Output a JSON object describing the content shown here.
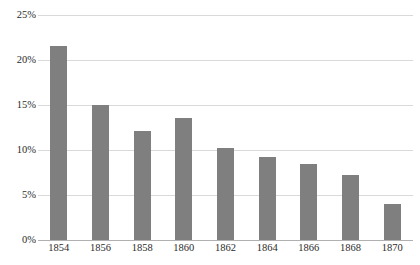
{
  "chart_data": {
    "type": "bar",
    "title": "",
    "subtitle": "",
    "xlabel": "",
    "ylabel": "",
    "categories": [
      "1854",
      "1856",
      "1858",
      "1860",
      "1862",
      "1864",
      "1866",
      "1868",
      "1870"
    ],
    "values": [
      21.6,
      15.0,
      12.1,
      13.6,
      10.2,
      9.2,
      8.4,
      7.2,
      4.0
    ],
    "ylim": [
      0,
      25
    ],
    "yticks": [
      0,
      5,
      10,
      15,
      20,
      25
    ],
    "ytick_labels": [
      "0%",
      "5%",
      "10%",
      "15%",
      "20%",
      "25%"
    ],
    "grid": true,
    "grid_axis": "y",
    "legend": false,
    "legend_position": "none",
    "bar_color": "#7f7f7f",
    "grid_color": "#d9d9d9",
    "axis_color": "#b0b0b0",
    "text_color": "#2b2b2b",
    "background_color": "#ffffff"
  }
}
